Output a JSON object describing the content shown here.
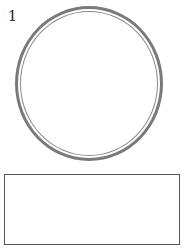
{
  "question": {
    "number": "1"
  },
  "figure": {
    "shape": "double-ring-circle",
    "stroke_color": "#7a7a7a"
  },
  "answer_box": {
    "value": ""
  }
}
